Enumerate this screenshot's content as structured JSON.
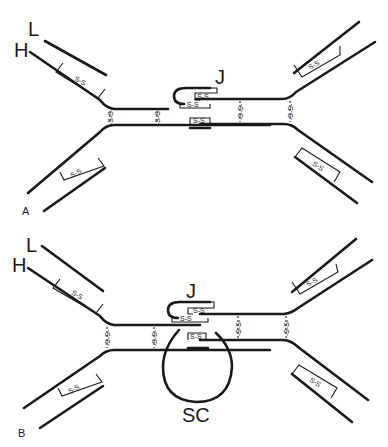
{
  "figure": {
    "panels": [
      {
        "id": "A",
        "label": "A",
        "chain_labels": {
          "light": "L",
          "heavy": "H",
          "j_chain": "J"
        },
        "disulfide_label": "S-S"
      },
      {
        "id": "B",
        "label": "B",
        "chain_labels": {
          "light": "L",
          "heavy": "H",
          "j_chain": "J",
          "secretory_component": "SC"
        },
        "disulfide_label": "S-S"
      }
    ]
  },
  "colors": {
    "line": "#1a1a1a",
    "background": "#ffffff"
  }
}
